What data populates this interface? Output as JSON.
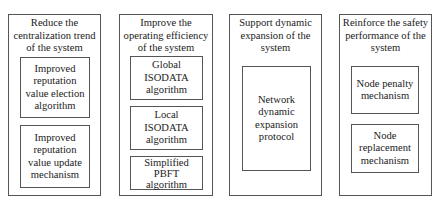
{
  "diagram": {
    "columns": [
      {
        "title": "Reduce the\ncentralization trend\nof the system",
        "items": [
          "Improved\nreputation\nvalue election\nalgorithm",
          "Improved\nreputation\nvalue update\nmechanism"
        ]
      },
      {
        "title": "Improve the\noperating efficiency\nof the system",
        "items": [
          "Global\nISODATA\nalgorithm",
          "Local\nISODATA\nalgorithm",
          "Simplified\nPBFT\nalgorithm"
        ]
      },
      {
        "title": "Support dynamic\nexpansion of the\nsystem",
        "items": [
          "Network\ndynamic\nexpansion\nprotocol"
        ]
      },
      {
        "title": "Reinforce the safety\nperformance of the\nsystem",
        "items": [
          "Node penalty\nmechanism",
          "Node\nreplacement\nmechanism"
        ]
      }
    ]
  }
}
